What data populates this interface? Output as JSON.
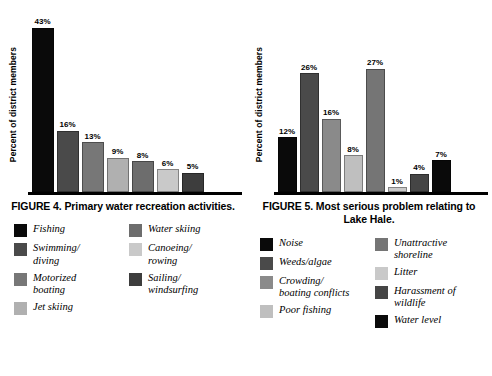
{
  "figures": [
    {
      "id": "figure-4",
      "caption": "FIGURE 4.  Primary water\nrecreation activities.",
      "ylabel": "Percent of district members",
      "chart_data": {
        "type": "bar",
        "title": "FIGURE 4.  Primary water recreation activities.",
        "xlabel": "",
        "ylabel": "Percent of district members",
        "ylim": [
          0,
          45
        ],
        "grid": false,
        "legend_position": "below",
        "categories": [
          "Fishing",
          "Swimming/ diving",
          "Motorized boating",
          "Jet skiing",
          "Water skiing",
          "Canoeing/ rowing",
          "Sailing/ windsurfing"
        ],
        "values": [
          43,
          16,
          13,
          9,
          8,
          6,
          5
        ],
        "data_labels": [
          "43%",
          "16%",
          "13%",
          "9%",
          "8%",
          "6%",
          "5%"
        ],
        "colors": [
          "#0a0a0a",
          "#4a4a4a",
          "#777777",
          "#b0b0b0",
          "#6d6d6d",
          "#c9c9c9",
          "#3d3d3d"
        ]
      },
      "legend": {
        "columns": [
          [
            {
              "label": "Fishing",
              "color": "#0a0a0a",
              "swatch_name": "legend-swatch-fishing"
            },
            {
              "label": "Swimming/\ndiving",
              "color": "#4a4a4a",
              "swatch_name": "legend-swatch-swimming-diving"
            },
            {
              "label": "Motorized\nboating",
              "color": "#777777",
              "swatch_name": "legend-swatch-motorized-boating"
            },
            {
              "label": "Jet skiing",
              "color": "#b0b0b0",
              "swatch_name": "legend-swatch-jet-skiing"
            }
          ],
          [
            {
              "label": "Water skiing",
              "color": "#6d6d6d",
              "swatch_name": "legend-swatch-water-skiing"
            },
            {
              "label": "Canoeing/\nrowing",
              "color": "#c9c9c9",
              "swatch_name": "legend-swatch-canoeing-rowing"
            },
            {
              "label": "Sailing/\nwindsurfing",
              "color": "#3d3d3d",
              "swatch_name": "legend-swatch-sailing-windsurfing"
            }
          ]
        ]
      }
    },
    {
      "id": "figure-5",
      "caption": "FIGURE 5. Most serious problem\nrelating to Lake Hale.",
      "ylabel": "Percent of district members",
      "chart_data": {
        "type": "bar",
        "title": "FIGURE 5. Most serious problem relating to Lake Hale.",
        "xlabel": "",
        "ylabel": "Percent of district members",
        "ylim": [
          0,
          28
        ],
        "grid": false,
        "legend_position": "below",
        "categories": [
          "Noise",
          "Weeds/algae",
          "Crowding/ boating conflicts",
          "Poor fishing",
          "Unattractive shoreline",
          "Litter",
          "Harassment of wildlife",
          "Water level"
        ],
        "values": [
          12,
          26,
          16,
          8,
          27,
          1,
          4,
          7
        ],
        "data_labels": [
          "12%",
          "26%",
          "16%",
          "8%",
          "27%",
          "1%",
          "4%",
          "7%"
        ],
        "colors": [
          "#0a0a0a",
          "#4a4a4a",
          "#8a8a8a",
          "#bfbfbf",
          "#757575",
          "#c9c9c9",
          "#454545",
          "#0a0a0a"
        ]
      },
      "legend": {
        "columns": [
          [
            {
              "label": "Noise",
              "color": "#0a0a0a",
              "swatch_name": "legend-swatch-noise"
            },
            {
              "label": "Weeds/algae",
              "color": "#4a4a4a",
              "swatch_name": "legend-swatch-weeds-algae"
            },
            {
              "label": "Crowding/\nboating conflicts",
              "color": "#8a8a8a",
              "swatch_name": "legend-swatch-crowding-boating-conflicts"
            },
            {
              "label": "Poor fishing",
              "color": "#bfbfbf",
              "swatch_name": "legend-swatch-poor-fishing"
            }
          ],
          [
            {
              "label": "Unattractive\nshoreline",
              "color": "#757575",
              "swatch_name": "legend-swatch-unattractive-shoreline"
            },
            {
              "label": "Litter",
              "color": "#c9c9c9",
              "swatch_name": "legend-swatch-litter"
            },
            {
              "label": "Harassment of\nwildlife",
              "color": "#454545",
              "swatch_name": "legend-swatch-harassment-of-wildlife"
            },
            {
              "label": "Water level",
              "color": "#0a0a0a",
              "swatch_name": "legend-swatch-water-level"
            }
          ]
        ]
      }
    }
  ]
}
